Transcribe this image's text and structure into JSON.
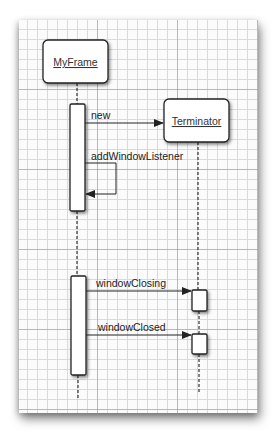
{
  "diagram": {
    "type": "uml-sequence",
    "objects": [
      {
        "id": "myframe",
        "label": "MyFrame"
      },
      {
        "id": "terminator",
        "label": "Terminator"
      }
    ],
    "messages": [
      {
        "from": "myframe",
        "to": "terminator",
        "label": "new"
      },
      {
        "from": "myframe",
        "to": "myframe",
        "label": "addWindowListener"
      },
      {
        "from": "myframe",
        "to": "terminator",
        "label": "windowClosing"
      },
      {
        "from": "myframe",
        "to": "terminator",
        "label": "windowClosed"
      }
    ],
    "colors": {
      "line": "#222222",
      "box_fill": "#ffffff",
      "grid": "#dadada",
      "grid_major": "#9a9a9a"
    }
  }
}
